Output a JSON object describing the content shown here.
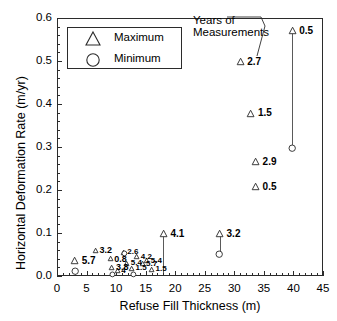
{
  "chart_data": {
    "type": "scatter",
    "title": "",
    "xlabel": "Refuse Fill Thickness (m)",
    "ylabel": "Horizontal Deformation Rate (m/yr)",
    "xlim": [
      0,
      45
    ],
    "ylim": [
      0.0,
      0.6
    ],
    "xticks": [
      0,
      5,
      10,
      15,
      20,
      25,
      30,
      35,
      40,
      45
    ],
    "xticklabels": [
      "0",
      "5",
      "10",
      "15",
      "20",
      "25",
      "30",
      "35",
      "40",
      "45"
    ],
    "yticks": [
      0.0,
      0.1,
      0.2,
      0.3,
      0.4,
      0.5,
      0.6
    ],
    "yticklabels": [
      "0.0",
      "0.1",
      "0.2",
      "0.3",
      "0.4",
      "0.5",
      "0.6"
    ],
    "grid": false,
    "minor_ticks": true,
    "legend_position": "upper-left",
    "legend": [
      {
        "marker": "triangle",
        "label": "Maximum"
      },
      {
        "marker": "circle",
        "label": "Minimum"
      }
    ],
    "annotation": {
      "text_line1": "Years of",
      "text_line2": "Measurements",
      "note": "leader line points to the 2.7 data label"
    },
    "point_label_meaning": "Years of Measurements",
    "series": [
      {
        "name": "Maximum",
        "marker": "triangle",
        "points": [
          {
            "x": 3.0,
            "y": 0.035,
            "label": "5.7"
          },
          {
            "x": 6.5,
            "y": 0.06,
            "label": "3.2"
          },
          {
            "x": 9.0,
            "y": 0.04,
            "label": "0.8"
          },
          {
            "x": 9.3,
            "y": 0.02,
            "label": "3.8"
          },
          {
            "x": 10.2,
            "y": 0.012,
            "label": "4"
          },
          {
            "x": 11.2,
            "y": 0.055,
            "label": "2.6"
          },
          {
            "x": 11.8,
            "y": 0.03,
            "label": "5.4"
          },
          {
            "x": 12.6,
            "y": 0.018,
            "label": "1.5"
          },
          {
            "x": 13.5,
            "y": 0.045,
            "label": "4.2"
          },
          {
            "x": 14.4,
            "y": 0.028,
            "label": "5.7"
          },
          {
            "x": 15.2,
            "y": 0.036,
            "label": "5.4"
          },
          {
            "x": 16.0,
            "y": 0.016,
            "label": "1.5"
          },
          {
            "x": 18.0,
            "y": 0.098,
            "label": "4.1"
          },
          {
            "x": 27.5,
            "y": 0.098,
            "label": "3.2"
          },
          {
            "x": 31.0,
            "y": 0.498,
            "label": "2.7"
          },
          {
            "x": 32.8,
            "y": 0.378,
            "label": "1.5"
          },
          {
            "x": 33.6,
            "y": 0.266,
            "label": "2.9"
          },
          {
            "x": 33.6,
            "y": 0.207,
            "label": "0.5"
          },
          {
            "x": 39.8,
            "y": 0.57,
            "label": "0.5"
          }
        ]
      },
      {
        "name": "Minimum",
        "marker": "circle",
        "points": [
          {
            "x": 3.0,
            "y": 0.012
          },
          {
            "x": 9.4,
            "y": 0.003
          },
          {
            "x": 11.4,
            "y": 0.052
          },
          {
            "x": 13.0,
            "y": 0.004
          },
          {
            "x": 27.5,
            "y": 0.05
          },
          {
            "x": 39.8,
            "y": 0.298
          }
        ]
      }
    ],
    "connectors": [
      {
        "x": 18.0,
        "y_top": 0.098,
        "y_bottom": 0.006
      },
      {
        "x": 27.5,
        "y_top": 0.098,
        "y_bottom": 0.05
      },
      {
        "x": 39.8,
        "y_top": 0.57,
        "y_bottom": 0.298
      }
    ]
  }
}
